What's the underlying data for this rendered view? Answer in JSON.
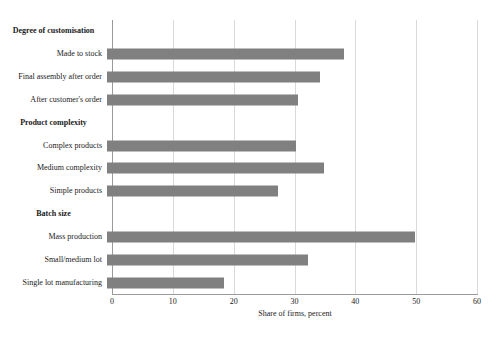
{
  "chart_data": {
    "type": "bar",
    "orientation": "horizontal",
    "title": "",
    "xlabel": "Share of firms, percent",
    "ylabel": "",
    "xlim": [
      0,
      60
    ],
    "xticks": [
      0,
      10,
      20,
      30,
      40,
      50,
      60
    ],
    "xtick_labels": [
      "0",
      "10",
      "20",
      "30",
      "40",
      "50",
      "60"
    ],
    "grid": true,
    "legend": false,
    "bar_color": "#808080",
    "gridline_color": "#d9d9d9",
    "axis_color": "#9a9a9a",
    "groups": [
      {
        "label": "Degree of customisation",
        "categories": [
          "Made to stock",
          "Final assembly after order",
          "After customer's order"
        ],
        "values": [
          39,
          35,
          31.4
        ]
      },
      {
        "label": "Product complexity",
        "categories": [
          "Complex products",
          "Medium complexity",
          "Simple products"
        ],
        "values": [
          31,
          35.7,
          28.1
        ]
      },
      {
        "label": "Batch size",
        "categories": [
          "Mass production",
          "Small/medium lot",
          "Single lot manufacturing"
        ],
        "values": [
          50.6,
          33,
          19.2
        ]
      }
    ],
    "rows": [
      {
        "type": "group",
        "label": "Degree of customisation",
        "value": null
      },
      {
        "type": "bar",
        "label": "Made to stock",
        "value": 39
      },
      {
        "type": "bar",
        "label": "Final assembly after order",
        "value": 35
      },
      {
        "type": "bar",
        "label": "After customer's order",
        "value": 31.4
      },
      {
        "type": "group",
        "label": "Product complexity",
        "value": null
      },
      {
        "type": "bar",
        "label": "Complex products",
        "value": 31
      },
      {
        "type": "bar",
        "label": "Medium complexity",
        "value": 35.7
      },
      {
        "type": "bar",
        "label": "Simple products",
        "value": 28.1
      },
      {
        "type": "group",
        "label": "Batch size",
        "value": null
      },
      {
        "type": "bar",
        "label": "Mass production",
        "value": 50.6
      },
      {
        "type": "bar",
        "label": "Small/medium lot",
        "value": 33
      },
      {
        "type": "bar",
        "label": "Single lot manufacturing",
        "value": 19.2
      }
    ]
  }
}
